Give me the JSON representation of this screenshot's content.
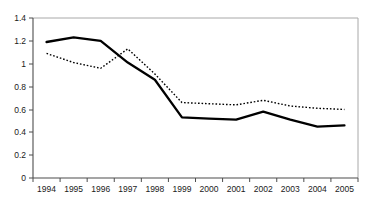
{
  "chart_data": {
    "type": "line",
    "title": "",
    "subtitle": "",
    "xlabel": "",
    "ylabel": "",
    "categories": [
      "1994",
      "1995",
      "1996",
      "1997",
      "1998",
      "1999",
      "2000",
      "2001",
      "2002",
      "2003",
      "2004",
      "2005"
    ],
    "x": [
      1994,
      1995,
      1996,
      1997,
      1998,
      1999,
      2000,
      2001,
      2002,
      2003,
      2004,
      2005
    ],
    "series": [
      {
        "name": "solid-series",
        "style": "solid",
        "color": "#000000",
        "values": [
          1.19,
          1.23,
          1.2,
          1.01,
          0.86,
          0.53,
          0.52,
          0.51,
          0.58,
          0.51,
          0.45,
          0.46
        ]
      },
      {
        "name": "dotted-series",
        "style": "dotted",
        "color": "#000000",
        "values": [
          1.09,
          1.01,
          0.96,
          1.13,
          0.91,
          0.66,
          0.65,
          0.64,
          0.68,
          0.63,
          0.61,
          0.6
        ]
      }
    ],
    "ylim": [
      0,
      1.4
    ],
    "yticks": [
      0,
      0.2,
      0.4,
      0.6,
      0.8,
      1,
      1.2,
      1.4
    ],
    "ytick_labels": [
      "0",
      "0.2",
      "0.4",
      "0.6",
      "0.8",
      "1",
      "1.2",
      "1.4"
    ],
    "xlim": [
      1994,
      2005
    ],
    "grid": false,
    "legend": "none",
    "plot_border_color": "#a8a8a8",
    "axis_color": "#4d4d4d"
  }
}
